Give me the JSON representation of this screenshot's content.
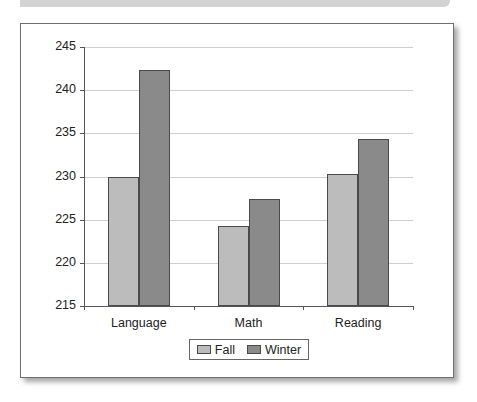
{
  "chart_data": {
    "type": "bar",
    "title": "",
    "xlabel": "",
    "ylabel": "",
    "categories": [
      "Language",
      "Math",
      "Reading"
    ],
    "series": [
      {
        "name": "Fall",
        "color": "#bcbcbc",
        "values": [
          230.0,
          224.3,
          230.3
        ]
      },
      {
        "name": "Winter",
        "color": "#8a8a8a",
        "values": [
          242.3,
          227.4,
          234.3
        ]
      }
    ],
    "ylim": [
      215,
      245
    ],
    "yticks": [
      "245",
      "240",
      "235",
      "230",
      "225",
      "220",
      "215"
    ],
    "grid": true,
    "legend_position": "bottom"
  },
  "legend": {
    "fall_label": "Fall",
    "winter_label": "Winter"
  }
}
